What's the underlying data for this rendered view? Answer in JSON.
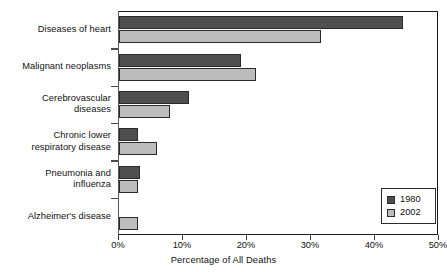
{
  "chart_data": {
    "type": "bar",
    "orientation": "horizontal",
    "title": "",
    "xlabel": "Percentage of All Deaths",
    "ylabel": "",
    "xlim": [
      0,
      50
    ],
    "xticks": [
      "0%",
      "10%",
      "20%",
      "30%",
      "40%",
      "50%"
    ],
    "xtick_values": [
      0,
      10,
      20,
      30,
      40,
      50
    ],
    "grid": false,
    "legend_position": "lower-right",
    "categories": [
      "Diseases of heart",
      "Malignant neoplasms",
      "Cerebrovascular\ndiseases",
      "Chronic lower\nrespiratory disease",
      "Pneumonia and\ninfluenza",
      "Alzheimer's disease"
    ],
    "series": [
      {
        "name": "1980",
        "color": "#4f4f4f",
        "values": [
          44.4,
          19.0,
          11.0,
          3.0,
          3.3,
          0
        ]
      },
      {
        "name": "2002",
        "color": "#bcbcbc",
        "values": [
          31.6,
          21.4,
          8.0,
          5.9,
          3.0,
          3.0
        ]
      }
    ]
  },
  "legend": {
    "entries": [
      {
        "label": "1980"
      },
      {
        "label": "2002"
      }
    ]
  }
}
